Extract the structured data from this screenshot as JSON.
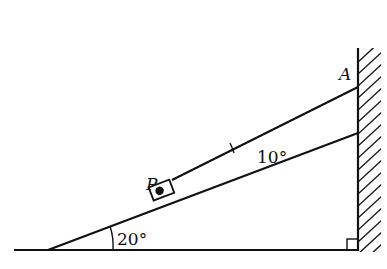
{
  "diagram": {
    "labels": {
      "point_p": "P",
      "point_a": "A",
      "incline_angle": "20°",
      "rope_angle": "10°"
    },
    "colors": {
      "line": "#111111",
      "background": "#ffffff"
    }
  }
}
